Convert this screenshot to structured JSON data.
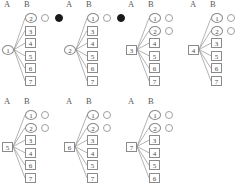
{
  "figure": {
    "columns": {
      "a_label": "A",
      "b_label": "B"
    },
    "node_shapes": {
      "ellipse_nodes": [
        1,
        2
      ],
      "square_nodes": [
        3,
        4,
        5,
        6,
        7
      ]
    },
    "colors": {
      "stroke": "#8a8a8a",
      "text": "#4a4a4a",
      "filled_dot": "#1a1a1a",
      "empty_dot_border": "#a0a0a0",
      "background": "#ffffff"
    },
    "all_nodes": [
      "1",
      "2",
      "3",
      "4",
      "5",
      "6",
      "7"
    ],
    "panels": [
      {
        "index": 1,
        "header_a": "A",
        "header_b": "B",
        "source": {
          "label": "1",
          "shape": "ellipse"
        },
        "targets": [
          {
            "label": "2",
            "shape": "ellipse"
          },
          {
            "label": "3",
            "shape": "square"
          },
          {
            "label": "4",
            "shape": "square"
          },
          {
            "label": "5",
            "shape": "square"
          },
          {
            "label": "6",
            "shape": "square"
          },
          {
            "label": "7",
            "shape": "square"
          }
        ],
        "status_dots": [
          {
            "row": 0,
            "state": "empty"
          },
          {
            "row": 0,
            "state": "filled"
          }
        ]
      },
      {
        "index": 2,
        "header_a": "A",
        "header_b": "B",
        "source": {
          "label": "2",
          "shape": "ellipse"
        },
        "targets": [
          {
            "label": "1",
            "shape": "ellipse"
          },
          {
            "label": "3",
            "shape": "square"
          },
          {
            "label": "4",
            "shape": "square"
          },
          {
            "label": "5",
            "shape": "square"
          },
          {
            "label": "6",
            "shape": "square"
          },
          {
            "label": "7",
            "shape": "square"
          }
        ],
        "status_dots": [
          {
            "row": 0,
            "state": "empty"
          },
          {
            "row": 0,
            "state": "filled"
          }
        ]
      },
      {
        "index": 3,
        "header_a": "A",
        "header_b": "B",
        "source": {
          "label": "3",
          "shape": "square"
        },
        "targets": [
          {
            "label": "1",
            "shape": "ellipse"
          },
          {
            "label": "2",
            "shape": "ellipse"
          },
          {
            "label": "4",
            "shape": "square"
          },
          {
            "label": "5",
            "shape": "square"
          },
          {
            "label": "6",
            "shape": "square"
          },
          {
            "label": "7",
            "shape": "square"
          }
        ],
        "status_dots": [
          {
            "row": 0,
            "state": "empty"
          },
          {
            "row": 1,
            "state": "empty"
          }
        ]
      },
      {
        "index": 4,
        "header_a": "A",
        "header_b": "B",
        "source": {
          "label": "4",
          "shape": "square"
        },
        "targets": [
          {
            "label": "1",
            "shape": "ellipse"
          },
          {
            "label": "2",
            "shape": "ellipse"
          },
          {
            "label": "3",
            "shape": "square"
          },
          {
            "label": "5",
            "shape": "square"
          },
          {
            "label": "6",
            "shape": "square"
          },
          {
            "label": "7",
            "shape": "square"
          }
        ],
        "status_dots": [
          {
            "row": 0,
            "state": "empty"
          },
          {
            "row": 1,
            "state": "empty"
          }
        ]
      },
      {
        "index": 5,
        "header_a": "A",
        "header_b": "B",
        "source": {
          "label": "5",
          "shape": "square"
        },
        "targets": [
          {
            "label": "1",
            "shape": "ellipse"
          },
          {
            "label": "2",
            "shape": "ellipse"
          },
          {
            "label": "3",
            "shape": "square"
          },
          {
            "label": "4",
            "shape": "square"
          },
          {
            "label": "6",
            "shape": "square"
          },
          {
            "label": "7",
            "shape": "square"
          }
        ],
        "status_dots": [
          {
            "row": 0,
            "state": "empty"
          },
          {
            "row": 1,
            "state": "empty"
          }
        ]
      },
      {
        "index": 6,
        "header_a": "A",
        "header_b": "B",
        "source": {
          "label": "6",
          "shape": "square"
        },
        "targets": [
          {
            "label": "1",
            "shape": "ellipse"
          },
          {
            "label": "2",
            "shape": "ellipse"
          },
          {
            "label": "3",
            "shape": "square"
          },
          {
            "label": "4",
            "shape": "square"
          },
          {
            "label": "5",
            "shape": "square"
          },
          {
            "label": "7",
            "shape": "square"
          }
        ],
        "status_dots": [
          {
            "row": 0,
            "state": "empty"
          },
          {
            "row": 1,
            "state": "empty"
          }
        ]
      },
      {
        "index": 7,
        "header_a": "A",
        "header_b": "B",
        "source": {
          "label": "7",
          "shape": "square"
        },
        "targets": [
          {
            "label": "1",
            "shape": "ellipse"
          },
          {
            "label": "2",
            "shape": "ellipse"
          },
          {
            "label": "3",
            "shape": "square"
          },
          {
            "label": "4",
            "shape": "square"
          },
          {
            "label": "5",
            "shape": "square"
          },
          {
            "label": "6",
            "shape": "square"
          }
        ],
        "status_dots": [
          {
            "row": 0,
            "state": "empty"
          },
          {
            "row": 1,
            "state": "empty"
          }
        ]
      }
    ],
    "layout": {
      "panel_positions": [
        {
          "x": 0,
          "y": 0
        },
        {
          "x": 62,
          "y": 0
        },
        {
          "x": 124,
          "y": 0
        },
        {
          "x": 186,
          "y": 0
        },
        {
          "x": 0,
          "y": 97
        },
        {
          "x": 62,
          "y": 97
        },
        {
          "x": 124,
          "y": 97
        }
      ]
    }
  }
}
